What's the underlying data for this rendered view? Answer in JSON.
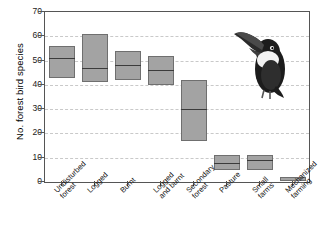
{
  "chart_data": {
    "type": "bar",
    "title": "",
    "xlabel": "",
    "ylabel": "No. forest bird species",
    "ylim": [
      0,
      70
    ],
    "yticks": [
      0,
      10,
      20,
      30,
      40,
      50,
      60,
      70
    ],
    "grid": true,
    "legend": "none",
    "categories": [
      "Undisturbed forest",
      "Logged",
      "Burnt",
      "Logged and burnt",
      "Secondary forest",
      "Pasture",
      "Small farms",
      "Mechanized farming"
    ],
    "category_lines": [
      [
        "Undisturbed",
        "forest"
      ],
      [
        "Logged"
      ],
      [
        "Burnt"
      ],
      [
        "Logged",
        "and burnt"
      ],
      [
        "Secondary",
        "forest"
      ],
      [
        "Pasture"
      ],
      [
        "Small",
        "farms"
      ],
      [
        "Mechanized",
        "farming"
      ]
    ],
    "series": [
      {
        "name": "range (box)",
        "lower": [
          43,
          41,
          42,
          40,
          17,
          5,
          5,
          0.5
        ],
        "upper": [
          56,
          61,
          54,
          52,
          42,
          11,
          11,
          2
        ],
        "median": [
          51,
          47,
          48,
          46,
          30,
          8,
          9,
          1
        ]
      }
    ],
    "values": [
      51,
      47,
      48,
      46,
      30,
      8,
      9,
      1
    ],
    "annotation": "toucan-illustration"
  },
  "colors": {
    "bar_fill": "#a3a3a3",
    "bar_edge": "#6f6f6f",
    "median_line": "#3b3b3b",
    "axis": "#555555",
    "grid": "#c9c9c9",
    "text": "#111111",
    "background": "#ffffff"
  }
}
